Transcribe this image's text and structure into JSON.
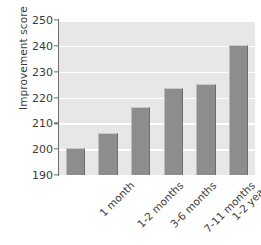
{
  "chart_data": {
    "type": "bar",
    "title": "",
    "xlabel": "",
    "ylabel": "Improvement score",
    "categories": [
      "1 month",
      "1-2 months",
      "3-6 months",
      "7-11 months",
      "1-2 years",
      ">2 years"
    ],
    "values": [
      200.3,
      206.3,
      216.5,
      223.5,
      225.3,
      240.5
    ],
    "ylim": [
      190,
      250
    ],
    "yticks": [
      190,
      200,
      210,
      220,
      230,
      240,
      250
    ],
    "ytick_labels": [
      "190",
      "200",
      "210",
      "220",
      "230",
      "240",
      "250"
    ],
    "grid": true,
    "grid_color": "#ffffff",
    "legend": false,
    "legend_position": "none",
    "bar_color": "#8d8d8d",
    "plot_background": "#e7e7e7",
    "figure_background": "#ffffff",
    "xtick_rotation": -45
  }
}
